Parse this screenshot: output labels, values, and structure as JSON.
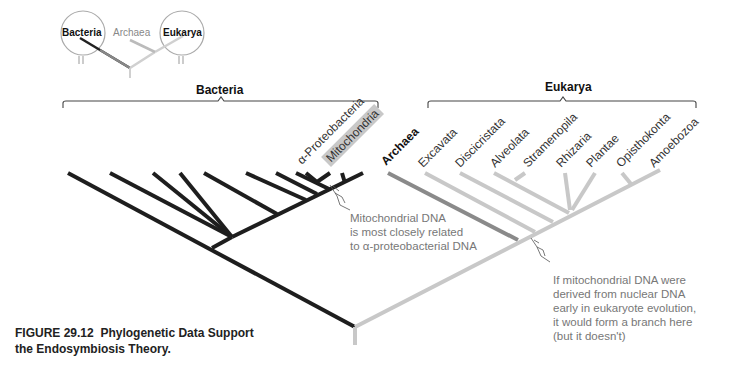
{
  "inset": {
    "labels": {
      "bacteria": "Bacteria",
      "archaea": "Archaea",
      "eukarya": "Eukarya"
    }
  },
  "clades": {
    "bacteria": "Bacteria",
    "eukarya": "Eukarya"
  },
  "taxa": {
    "alpha_proteobacteria": "α-Proteobacteria",
    "mitochondria": "Mitochondria",
    "archaea": "Archaea",
    "eukarya": [
      "Excavata",
      "Discicristata",
      "Alveolata",
      "Stramenopila",
      "Rhizaria",
      "Plantae",
      "Opisthokonta",
      "Amoebozoa"
    ]
  },
  "notes": {
    "mito_related": [
      "Mitochondrial DNA",
      "is most closely related",
      "to α-proteobacterial DNA"
    ],
    "nuclear_branch": [
      "If mitochondrial DNA were",
      "derived from nuclear DNA",
      "early in eukaryote evolution,",
      "it would form a branch here",
      "(but it doesn't)"
    ]
  },
  "caption": {
    "number": "FIGURE 29.12",
    "title": "Phylogenetic Data Support the Endosymbiosis Theory."
  },
  "colors": {
    "bacteria_branch": "#1e1e1e",
    "archaea_branch": "#8a8a8a",
    "eukarya_branch": "#c8c8c8",
    "mito_highlight": "#c8c8c8",
    "note_text": "#777777"
  }
}
